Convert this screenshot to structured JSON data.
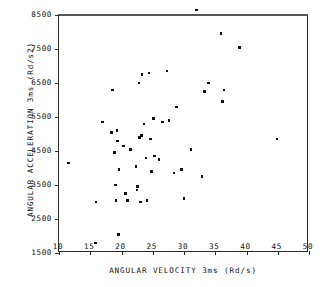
{
  "chart_data": {
    "type": "scatter",
    "title": "",
    "xlabel": "ANGULAR VELOCITY 3ms  (Rd/s)",
    "ylabel": "ANGULAR ACCELERATION 3ms  (Rd/s2)",
    "xlim": [
      10,
      50
    ],
    "ylim": [
      1500,
      8500
    ],
    "xticks": [
      10,
      15,
      20,
      25,
      30,
      35,
      40,
      45,
      50
    ],
    "yticks": [
      1500,
      2500,
      3500,
      4500,
      5500,
      6500,
      7500,
      8500
    ],
    "xtick_labels": [
      "10",
      "15",
      "20",
      "25",
      "30",
      "35",
      "40",
      "45",
      "50"
    ],
    "ytick_labels": [
      "1500",
      "2500",
      "3500",
      "4500",
      "5500",
      "6500",
      "7500",
      "8500"
    ],
    "grid": false,
    "legend": null,
    "marker": "square-dot",
    "marker_color": "#111111",
    "frame_color": "#2a2a2a",
    "background": "#ffffff",
    "n_points": 59,
    "points": [
      {
        "x": 11.5,
        "y": 4150
      },
      {
        "x": 15.8,
        "y": 1800
      },
      {
        "x": 15.9,
        "y": 3000
      },
      {
        "x": 17.0,
        "y": 5350
      },
      {
        "x": 18.4,
        "y": 5050
      },
      {
        "x": 18.6,
        "y": 6300
      },
      {
        "x": 18.9,
        "y": 4450
      },
      {
        "x": 19.0,
        "y": 3500
      },
      {
        "x": 19.1,
        "y": 3050
      },
      {
        "x": 19.3,
        "y": 5100
      },
      {
        "x": 19.4,
        "y": 4800
      },
      {
        "x": 19.5,
        "y": 2050
      },
      {
        "x": 19.6,
        "y": 3950
      },
      {
        "x": 20.3,
        "y": 4650
      },
      {
        "x": 20.6,
        "y": 3250
      },
      {
        "x": 21.0,
        "y": 3050
      },
      {
        "x": 21.4,
        "y": 4550
      },
      {
        "x": 22.3,
        "y": 4050
      },
      {
        "x": 22.5,
        "y": 3350
      },
      {
        "x": 22.6,
        "y": 3450
      },
      {
        "x": 22.8,
        "y": 6500
      },
      {
        "x": 22.9,
        "y": 4900
      },
      {
        "x": 23.0,
        "y": 3000
      },
      {
        "x": 23.2,
        "y": 4950
      },
      {
        "x": 23.3,
        "y": 6750
      },
      {
        "x": 23.6,
        "y": 5300
      },
      {
        "x": 23.9,
        "y": 4300
      },
      {
        "x": 24.1,
        "y": 3050
      },
      {
        "x": 24.4,
        "y": 6800
      },
      {
        "x": 24.6,
        "y": 4850
      },
      {
        "x": 24.8,
        "y": 3900
      },
      {
        "x": 25.1,
        "y": 5450
      },
      {
        "x": 25.3,
        "y": 4350
      },
      {
        "x": 26.0,
        "y": 4250
      },
      {
        "x": 26.6,
        "y": 5350
      },
      {
        "x": 27.3,
        "y": 6850
      },
      {
        "x": 27.6,
        "y": 5400
      },
      {
        "x": 28.4,
        "y": 3850
      },
      {
        "x": 28.8,
        "y": 5800
      },
      {
        "x": 29.6,
        "y": 3950
      },
      {
        "x": 30.0,
        "y": 3100
      },
      {
        "x": 31.1,
        "y": 4550
      },
      {
        "x": 32.0,
        "y": 8650
      },
      {
        "x": 32.9,
        "y": 3750
      },
      {
        "x": 33.3,
        "y": 6250
      },
      {
        "x": 33.9,
        "y": 6500
      },
      {
        "x": 35.9,
        "y": 7950
      },
      {
        "x": 36.2,
        "y": 5950
      },
      {
        "x": 36.4,
        "y": 6300
      },
      {
        "x": 38.9,
        "y": 7550
      },
      {
        "x": 44.9,
        "y": 4850
      }
    ]
  }
}
